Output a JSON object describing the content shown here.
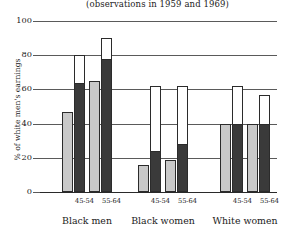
{
  "chart_data": {
    "type": "bar",
    "title": "",
    "subtitle": "(observations in 1959 and 1969)",
    "xlabel": "",
    "ylabel": "% of white men's earnings",
    "ylim": [
      0,
      100
    ],
    "yticks": [
      0,
      20,
      40,
      60,
      80,
      100
    ],
    "grid": true,
    "legend": "none",
    "groups": [
      "Black men",
      "Black women",
      "White women"
    ],
    "age_brackets": [
      "45-54",
      "55-64"
    ],
    "bar_style_legend": {
      "light_grey": "1959 observation",
      "dark_grey_with_white_extension": "1969 observation"
    },
    "colors": {
      "light_bar": "#c9c9c9",
      "dark_bar": "#3a3a3a",
      "open_bar": "#ffffff",
      "outline": "#2b2b2b",
      "gridline": "#5a5a5a"
    },
    "bars": [
      {
        "group": "Black men",
        "age": "45-54",
        "style": "light",
        "value": 47,
        "filled": 47
      },
      {
        "group": "Black men",
        "age": "45-54",
        "style": "dark",
        "value": 80,
        "filled": 64
      },
      {
        "group": "Black men",
        "age": "55-64",
        "style": "light",
        "value": 65,
        "filled": 65
      },
      {
        "group": "Black men",
        "age": "55-64",
        "style": "dark",
        "value": 90,
        "filled": 78
      },
      {
        "group": "Black women",
        "age": "45-54",
        "style": "light",
        "value": 16,
        "filled": 16
      },
      {
        "group": "Black women",
        "age": "45-54",
        "style": "dark",
        "value": 62,
        "filled": 24
      },
      {
        "group": "Black women",
        "age": "55-64",
        "style": "light",
        "value": 19,
        "filled": 19
      },
      {
        "group": "Black women",
        "age": "55-64",
        "style": "dark",
        "value": 62,
        "filled": 28
      },
      {
        "group": "White women",
        "age": "45-54",
        "style": "light",
        "value": 40,
        "filled": 40
      },
      {
        "group": "White women",
        "age": "45-54",
        "style": "dark",
        "value": 62,
        "filled": 40
      },
      {
        "group": "White women",
        "age": "55-64",
        "style": "light",
        "value": 40,
        "filled": 40
      },
      {
        "group": "White women",
        "age": "55-64",
        "style": "dark",
        "value": 57,
        "filled": 40
      }
    ]
  },
  "axis": {
    "ytick_labels": [
      "100",
      "80",
      "60",
      "40",
      "20",
      "0"
    ],
    "ylabel": "% of white men's earnings"
  },
  "subtitle": "(observations in 1959 and 1969)",
  "subcategories": [
    "45-54",
    "55-64",
    "45-54",
    "55-64",
    "45-54",
    "55-64"
  ],
  "group_labels": [
    "Black men",
    "Black women",
    "White women"
  ]
}
